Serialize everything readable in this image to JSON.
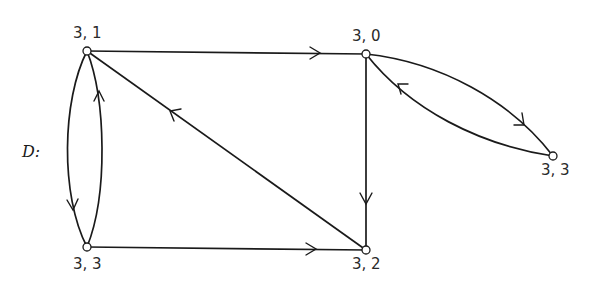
{
  "diagram": {
    "graph_name": "D:",
    "nodes": [
      {
        "id": "n31",
        "label": "3, 1",
        "x": 87,
        "y": 51
      },
      {
        "id": "n30",
        "label": "3, 0",
        "x": 366,
        "y": 54
      },
      {
        "id": "n33r",
        "label": "3, 3",
        "x": 553,
        "y": 156
      },
      {
        "id": "n32",
        "label": "3, 2",
        "x": 366,
        "y": 250
      },
      {
        "id": "n33l",
        "label": "3, 3",
        "x": 87,
        "y": 247
      }
    ],
    "edges": [
      {
        "from": "3, 1",
        "to": "3, 0",
        "shape": "straight"
      },
      {
        "from": "3, 0",
        "to": "3, 2",
        "shape": "straight"
      },
      {
        "from": "3, 3 (left)",
        "to": "3, 2",
        "shape": "straight"
      },
      {
        "from": "3, 2",
        "to": "3, 1",
        "shape": "straight"
      },
      {
        "from": "3, 1",
        "to": "3, 3 (left)",
        "shape": "curved-left"
      },
      {
        "from": "3, 3 (left)",
        "to": "3, 1",
        "shape": "curved-right"
      },
      {
        "from": "3, 0",
        "to": "3, 3 (right)",
        "shape": "curved-upper"
      },
      {
        "from": "3, 3 (right)",
        "to": "3, 0",
        "shape": "curved-lower"
      }
    ],
    "colors": {
      "stroke": "#1a1a1a",
      "node_fill": "#ffffff",
      "background": "#ffffff"
    }
  }
}
